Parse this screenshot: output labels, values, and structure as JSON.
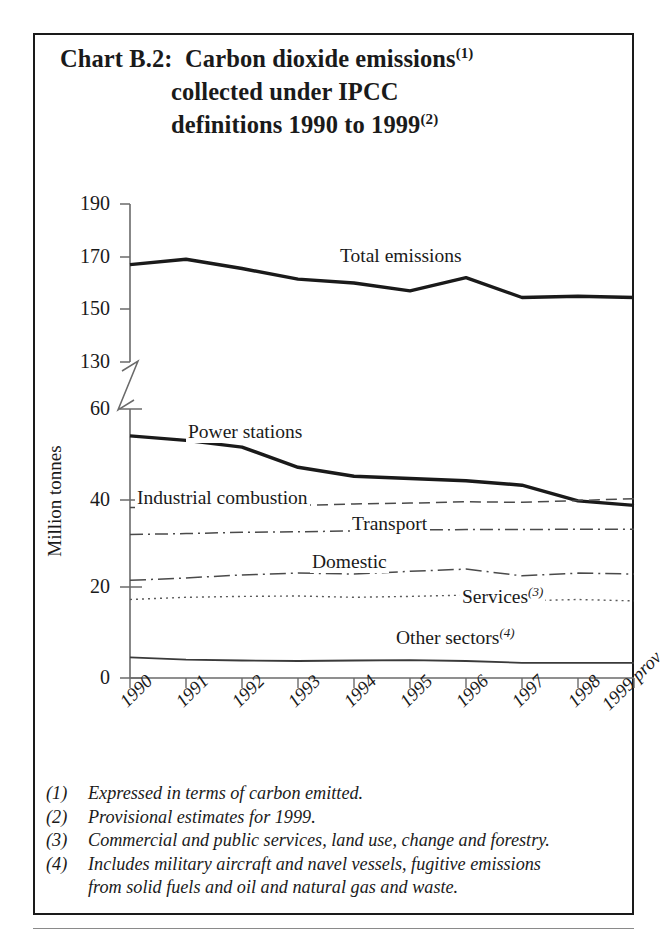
{
  "title": {
    "line1_prefix": "Chart B.2:",
    "line1": "Carbon dioxide emissions",
    "line1_sup": "(1)",
    "line2": "collected under IPCC",
    "line3": "definitions 1990 to 1999",
    "line3_sup": "(2)"
  },
  "axis": {
    "ylabel": "Million tonnes",
    "ytick_labels": [
      "190",
      "170",
      "150",
      "130",
      "60",
      "40",
      "20",
      "0"
    ],
    "xtick_labels": [
      "1990",
      "1991",
      "1992",
      "1993",
      "1994",
      "1995",
      "1996",
      "1997",
      "1998",
      "1999 prov"
    ],
    "break_note": "axis-break between 130 and 60"
  },
  "series_labels": {
    "total": "Total emissions",
    "power": "Power stations",
    "industrial": "Industrial combustion",
    "transport": "Transport",
    "domestic": "Domestic",
    "services": "Services",
    "services_sup": "(3)",
    "other": "Other sectors",
    "other_sup": "(4)"
  },
  "footnotes": [
    {
      "num": "(1)",
      "text": "Expressed in terms of carbon emitted."
    },
    {
      "num": "(2)",
      "text": "Provisional estimates for 1999."
    },
    {
      "num": "(3)",
      "text": "Commercial and public services, land use, change and forestry."
    },
    {
      "num": "(4)",
      "text": "Includes military aircraft and navel vessels, fugitive emissions",
      "text2": "from solid fuels and oil and natural gas and waste."
    }
  ],
  "colors": {
    "ink": "#1a1a1a",
    "axis": "#6a6a6a",
    "line_strong": "#1a1a1a",
    "line_light": "#4a4a4a",
    "background": "#ffffff"
  },
  "chart_data": {
    "type": "line",
    "xlabel": "",
    "ylabel": "Million tonnes",
    "x": [
      "1990",
      "1991",
      "1992",
      "1993",
      "1994",
      "1995",
      "1996",
      "1997",
      "1998",
      "1999 prov"
    ],
    "upper_axis": {
      "ylim": [
        130,
        190
      ],
      "ticks": [
        130,
        150,
        170,
        190
      ]
    },
    "lower_axis": {
      "ylim": [
        0,
        60
      ],
      "ticks": [
        0,
        20,
        40,
        60
      ]
    },
    "axis_break": [
      60,
      130
    ],
    "grid": false,
    "legend": "inline-labels",
    "series": [
      {
        "name": "Total emissions",
        "panel": "upper",
        "style": "solid-thick",
        "values": [
          167.0,
          169.0,
          165.5,
          161.5,
          160.0,
          157.0,
          162.0,
          154.5,
          155.0,
          154.5
        ]
      },
      {
        "name": "Power stations",
        "panel": "lower",
        "style": "solid-thick",
        "values": [
          54.0,
          53.0,
          51.5,
          47.0,
          45.0,
          44.5,
          44.0,
          43.0,
          39.5,
          38.5
        ]
      },
      {
        "name": "Industrial combustion",
        "panel": "lower",
        "style": "dashed",
        "values": [
          38.0,
          38.2,
          38.3,
          38.5,
          38.8,
          39.0,
          39.3,
          39.2,
          39.6,
          40.0
        ]
      },
      {
        "name": "Transport",
        "panel": "lower",
        "style": "dash-dot",
        "values": [
          32.0,
          32.2,
          32.5,
          32.6,
          32.8,
          33.0,
          33.1,
          33.1,
          33.2,
          33.2
        ]
      },
      {
        "name": "Domestic",
        "panel": "lower",
        "style": "long-dash-dot",
        "values": [
          21.8,
          22.3,
          23.0,
          23.4,
          23.2,
          23.8,
          24.3,
          22.8,
          23.4,
          23.2
        ]
      },
      {
        "name": "Services",
        "panel": "lower",
        "style": "dotted",
        "values": [
          17.5,
          18.0,
          18.2,
          18.3,
          18.0,
          18.2,
          18.5,
          17.2,
          17.5,
          17.2
        ]
      },
      {
        "name": "Other sectors",
        "panel": "lower",
        "style": "solid-thin",
        "values": [
          4.6,
          4.1,
          3.9,
          3.8,
          3.9,
          4.0,
          3.8,
          3.4,
          3.4,
          3.4
        ]
      }
    ]
  }
}
